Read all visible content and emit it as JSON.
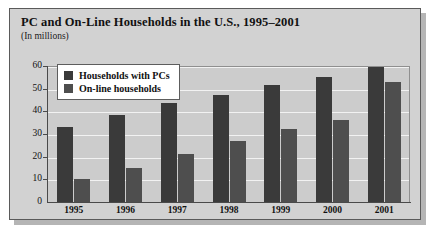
{
  "chart_data": {
    "type": "bar",
    "title": "PC and On-Line Households in the U.S., 1995–2001",
    "subtitle": "(In millions)",
    "xlabel": "",
    "ylabel": "",
    "ylim": [
      0,
      60
    ],
    "yticks": [
      0,
      10,
      20,
      30,
      40,
      50,
      60
    ],
    "grid": true,
    "legend_position": "top-left",
    "categories": [
      "1995",
      "1996",
      "1997",
      "1998",
      "1999",
      "2000",
      "2001"
    ],
    "series": [
      {
        "name": "Households with PCs",
        "color": "#3a3a3a",
        "values": [
          33,
          38.5,
          43.5,
          47,
          51.5,
          55,
          59.5
        ]
      },
      {
        "name": "On-line households",
        "color": "#4e4e4e",
        "values": [
          10,
          15,
          21,
          27,
          32,
          36,
          53
        ]
      }
    ]
  },
  "figure": {
    "background_color": "#d2d2d2",
    "plot_background_color": "#cccccc",
    "gridline_color": "#f2f2f2",
    "border_color": "#5a5a5a"
  }
}
